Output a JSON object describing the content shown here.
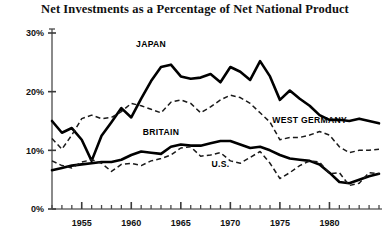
{
  "chart_data": {
    "type": "line",
    "title": "Net Investments as a Percentage of Net National Product",
    "xlabel": "",
    "ylabel": "",
    "xlim": [
      1952,
      1985
    ],
    "ylim": [
      0,
      30
    ],
    "yticks": [
      0,
      10,
      20,
      30
    ],
    "ytick_labels": [
      "0%",
      "10%",
      "20%",
      "30%"
    ],
    "xticks": [
      1955,
      1960,
      1965,
      1970,
      1975,
      1980
    ],
    "xtick_labels": [
      "1955",
      "1960",
      "1965",
      "1970",
      "1975",
      "1980"
    ],
    "minor_xtick_interval": 1,
    "grid": false,
    "legend": "inline-annotations",
    "x": [
      1952,
      1953,
      1954,
      1955,
      1956,
      1957,
      1958,
      1959,
      1960,
      1961,
      1962,
      1963,
      1964,
      1965,
      1966,
      1967,
      1968,
      1969,
      1970,
      1971,
      1972,
      1973,
      1974,
      1975,
      1976,
      1977,
      1978,
      1979,
      1980,
      1981,
      1982,
      1983,
      1984,
      1985
    ],
    "series": [
      {
        "name": "JAPAN",
        "style": "solid",
        "label_x": 1962,
        "label_y": 27.6,
        "values": [
          15.0,
          13.0,
          13.8,
          11.8,
          8.2,
          12.5,
          14.8,
          17.2,
          15.6,
          18.8,
          21.8,
          24.2,
          24.6,
          22.6,
          22.2,
          22.4,
          23.0,
          21.6,
          24.2,
          23.4,
          22.0,
          25.2,
          22.6,
          18.6,
          20.2,
          18.8,
          17.6,
          16.0,
          15.2,
          15.2,
          15.0,
          15.4,
          15.0,
          14.6
        ]
      },
      {
        "name": "WEST GERMANY",
        "style": "dashed",
        "label_x": 1978,
        "label_y": 14.6,
        "values": [
          12.0,
          10.2,
          12.6,
          15.4,
          16.0,
          15.4,
          15.6,
          16.6,
          18.0,
          17.6,
          17.0,
          16.4,
          18.2,
          18.6,
          18.0,
          16.4,
          17.4,
          18.6,
          19.4,
          19.0,
          18.0,
          16.4,
          14.8,
          11.8,
          12.2,
          12.2,
          12.6,
          13.2,
          12.6,
          10.6,
          9.6,
          10.0,
          10.0,
          10.2
        ]
      },
      {
        "name": "BRITAIN",
        "style": "solid",
        "label_x": 1963,
        "label_y": 12.6,
        "values": [
          6.6,
          7.0,
          7.4,
          7.6,
          7.8,
          8.0,
          8.0,
          8.4,
          9.2,
          9.8,
          9.6,
          9.4,
          10.6,
          11.0,
          10.8,
          10.8,
          11.2,
          11.6,
          11.6,
          11.0,
          10.4,
          10.6,
          10.0,
          9.2,
          8.6,
          8.4,
          8.2,
          7.6,
          6.2,
          4.6,
          4.4,
          5.0,
          5.6,
          6.0
        ]
      },
      {
        "name": "U.S.",
        "style": "dashed",
        "label_x": 1969,
        "label_y": 7.2,
        "values": [
          8.2,
          7.4,
          7.0,
          8.0,
          8.4,
          7.8,
          6.4,
          7.6,
          7.8,
          7.4,
          8.2,
          8.6,
          9.2,
          10.4,
          10.6,
          9.0,
          9.2,
          9.6,
          8.2,
          7.8,
          8.8,
          9.8,
          7.8,
          5.2,
          6.2,
          7.4,
          8.2,
          8.0,
          6.0,
          6.2,
          4.0,
          4.4,
          6.2,
          6.0
        ]
      }
    ]
  }
}
